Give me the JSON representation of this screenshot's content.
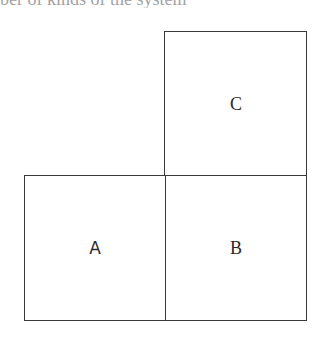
{
  "caption": {
    "text": "ber of kinds of the system"
  },
  "diagram": {
    "boxes": [
      {
        "id": "C",
        "label": "C",
        "x": 164,
        "y": 31,
        "w": 143,
        "h": 145
      },
      {
        "id": "A",
        "label": "A",
        "x": 24,
        "y": 175,
        "w": 142,
        "h": 146
      },
      {
        "id": "B",
        "label": "B",
        "x": 165,
        "y": 175,
        "w": 142,
        "h": 146
      }
    ],
    "colors": {
      "border": "#3a3a3a",
      "text": "#2a2a2a",
      "background": "#ffffff"
    }
  }
}
